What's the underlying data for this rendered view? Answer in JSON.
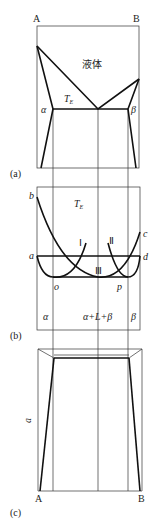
{
  "panel_a": {
    "label": "(a)",
    "corner_left": "A",
    "corner_right": "B",
    "region_liquid": "液体",
    "eutectic_temp": "T",
    "eutectic_sub": "E",
    "phase_alpha": "α",
    "phase_beta": "β"
  },
  "panel_b": {
    "label": "(b)",
    "temp": "T",
    "temp_sub": "E",
    "point_a": "a",
    "point_b": "b",
    "point_c": "c",
    "point_d": "d",
    "point_o": "o",
    "point_p": "p",
    "curve_1": "Ⅰ",
    "curve_2": "Ⅱ",
    "curve_3": "Ⅲ",
    "region_alpha": "α",
    "region_mix": "α+L+β",
    "region_beta": "β"
  },
  "panel_c": {
    "label": "(c)",
    "axis_label": "a",
    "corner_left": "A",
    "corner_right": "B"
  }
}
